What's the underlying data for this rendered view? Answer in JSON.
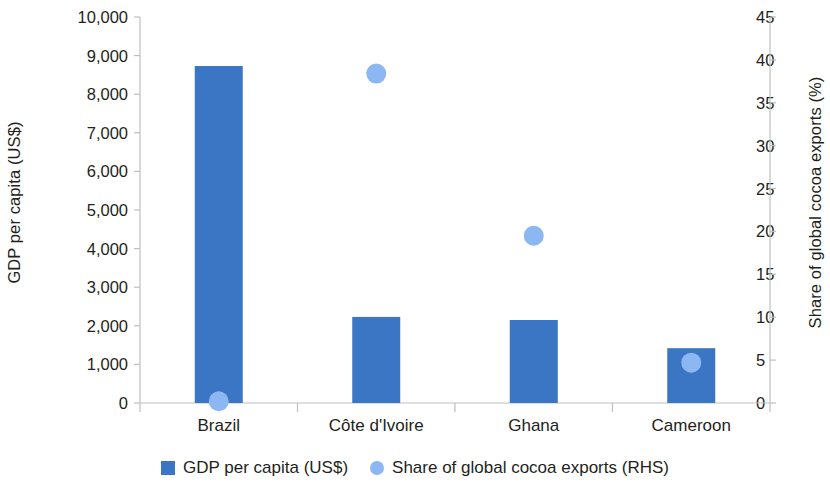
{
  "chart_data": {
    "type": "bar",
    "title": "",
    "subtitle": "",
    "xlabel": "",
    "ylabel": "GDP per capita (US$)",
    "y2label": "Share of global cocoa exports (%)",
    "categories": [
      "Brazil",
      "Côte d'Ivoire",
      "Ghana",
      "Cameroon"
    ],
    "grid": false,
    "legend_position": "bottom",
    "ylim": [
      0,
      10000
    ],
    "yticks": [
      0,
      1000,
      2000,
      3000,
      4000,
      5000,
      6000,
      7000,
      8000,
      9000,
      10000
    ],
    "ytick_labels": [
      "0",
      "1,000",
      "2,000",
      "3,000",
      "4,000",
      "5,000",
      "6,000",
      "7,000",
      "8,000",
      "9,000",
      "10,000"
    ],
    "y2lim": [
      0,
      45
    ],
    "y2ticks": [
      0,
      5,
      10,
      15,
      20,
      25,
      30,
      35,
      40,
      45
    ],
    "y2tick_labels": [
      "0",
      "5",
      "10",
      "15",
      "20",
      "25",
      "30",
      "35",
      "40",
      "45"
    ],
    "series": [
      {
        "name": "GDP per capita (US$)",
        "type": "bar",
        "axis": "left",
        "color": "#3a76c4",
        "values": [
          8730,
          2230,
          2150,
          1420
        ]
      },
      {
        "name": "Share of global cocoa exports (RHS)",
        "type": "scatter",
        "axis": "right",
        "color": "#8cb7f2",
        "values": [
          0.2,
          38.4,
          19.5,
          4.7
        ]
      }
    ]
  },
  "legend": {
    "items": [
      {
        "label": "GDP per capita (US$)",
        "marker": "square",
        "color": "#3a76c4"
      },
      {
        "label": "Share of global cocoa exports (RHS)",
        "marker": "circle",
        "color": "#8cb7f2"
      }
    ]
  },
  "colors": {
    "bar": "#3a76c4",
    "marker": "#8cb7f2",
    "axis": "#bfbfbf",
    "text": "#231f20",
    "background": "#ffffff"
  }
}
